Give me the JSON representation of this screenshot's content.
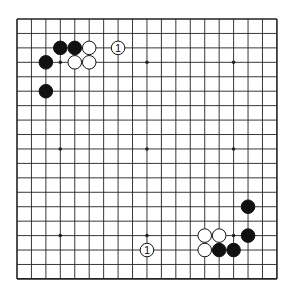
{
  "board": {
    "size": 19,
    "origin": {
      "x": 17,
      "y": 19
    },
    "spacing": 14.44,
    "line_color": "#222222",
    "background": "#ffffff",
    "hoshi": [
      [
        3,
        3
      ],
      [
        9,
        3
      ],
      [
        15,
        3
      ],
      [
        3,
        9
      ],
      [
        9,
        9
      ],
      [
        15,
        9
      ],
      [
        3,
        15
      ],
      [
        9,
        15
      ],
      [
        15,
        15
      ]
    ],
    "stones": [
      {
        "color": "black",
        "col": 3,
        "row": 2
      },
      {
        "color": "black",
        "col": 4,
        "row": 2
      },
      {
        "color": "white",
        "col": 5,
        "row": 2
      },
      {
        "color": "white",
        "col": 7,
        "row": 2,
        "label": "1"
      },
      {
        "color": "black",
        "col": 2,
        "row": 3
      },
      {
        "color": "white",
        "col": 4,
        "row": 3
      },
      {
        "color": "white",
        "col": 5,
        "row": 3
      },
      {
        "color": "black",
        "col": 2,
        "row": 5
      },
      {
        "color": "black",
        "col": 16,
        "row": 13
      },
      {
        "color": "white",
        "col": 13,
        "row": 15
      },
      {
        "color": "white",
        "col": 14,
        "row": 15
      },
      {
        "color": "black",
        "col": 16,
        "row": 15
      },
      {
        "color": "white",
        "col": 9,
        "row": 16,
        "label": "1"
      },
      {
        "color": "white",
        "col": 13,
        "row": 16
      },
      {
        "color": "black",
        "col": 14,
        "row": 16
      },
      {
        "color": "black",
        "col": 15,
        "row": 16
      }
    ]
  }
}
